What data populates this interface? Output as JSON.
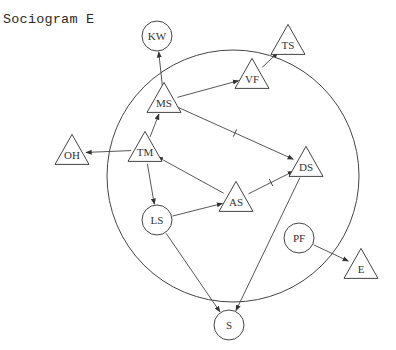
{
  "title": "Sociogram E",
  "colors": {
    "stroke": "#444444",
    "text": "#333333",
    "background": "#ffffff"
  },
  "boundary": {
    "shape": "circle",
    "cx": 233,
    "cy": 176,
    "r": 126
  },
  "nodes": [
    {
      "id": "KW",
      "label": "KW",
      "shape": "circle",
      "x": 157,
      "y": 36
    },
    {
      "id": "TS",
      "label": "TS",
      "shape": "triangle",
      "x": 288,
      "y": 43
    },
    {
      "id": "VF",
      "label": "VF",
      "shape": "triangle",
      "x": 252,
      "y": 77
    },
    {
      "id": "MS",
      "label": "MS",
      "shape": "triangle",
      "x": 164,
      "y": 101
    },
    {
      "id": "OH",
      "label": "OH",
      "shape": "triangle",
      "x": 72,
      "y": 153
    },
    {
      "id": "TM",
      "label": "TM",
      "shape": "triangle",
      "x": 145,
      "y": 150
    },
    {
      "id": "DS",
      "label": "DS",
      "shape": "triangle",
      "x": 306,
      "y": 165
    },
    {
      "id": "AS",
      "label": "AS",
      "shape": "triangle",
      "x": 236,
      "y": 200
    },
    {
      "id": "LS",
      "label": "LS",
      "shape": "circle",
      "x": 157,
      "y": 220
    },
    {
      "id": "PF",
      "label": "PF",
      "shape": "circle",
      "x": 299,
      "y": 238
    },
    {
      "id": "E",
      "label": "E",
      "shape": "triangle",
      "x": 361,
      "y": 267
    },
    {
      "id": "S",
      "label": "S",
      "shape": "circle",
      "x": 229,
      "y": 325
    }
  ],
  "edges": [
    {
      "from": "MS",
      "to": "KW",
      "marked": false
    },
    {
      "from": "MS",
      "to": "VF",
      "marked": false
    },
    {
      "from": "VF",
      "to": "TS",
      "marked": false
    },
    {
      "from": "MS",
      "to": "DS",
      "marked": true
    },
    {
      "from": "TM",
      "to": "MS",
      "marked": false
    },
    {
      "from": "TM",
      "to": "OH",
      "marked": false
    },
    {
      "from": "TM",
      "to": "LS",
      "marked": false
    },
    {
      "from": "AS",
      "to": "TM",
      "marked": false
    },
    {
      "from": "AS",
      "to": "DS",
      "marked": true
    },
    {
      "from": "LS",
      "to": "AS",
      "marked": false
    },
    {
      "from": "LS",
      "to": "S",
      "marked": false
    },
    {
      "from": "DS",
      "to": "S",
      "marked": false
    },
    {
      "from": "PF",
      "to": "E",
      "marked": false
    }
  ]
}
